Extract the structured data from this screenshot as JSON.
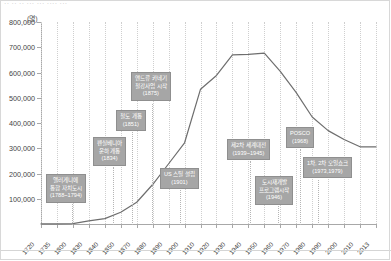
{
  "header": {
    "cut_off_text": "·· ·· ·· ··· ··· ···· ···"
  },
  "axis": {
    "unit_label": "(명)"
  },
  "chart_data": {
    "type": "line",
    "title": "",
    "subtitle": "",
    "xlabel": "",
    "ylabel": "(명)",
    "ylim": [
      0,
      800000
    ],
    "xlim": [
      1720,
      2013
    ],
    "grid": true,
    "legend_position": "none",
    "y_ticks": [
      "100,000",
      "200,000",
      "300,000",
      "400,000",
      "500,000",
      "600,000",
      "700,000",
      "800,000"
    ],
    "y_tick_values": [
      100000,
      200000,
      300000,
      400000,
      500000,
      600000,
      700000,
      800000
    ],
    "x_tick_labels": [
      "1720",
      "1735",
      "1800",
      "1830",
      "1840",
      "1850",
      "1870",
      "1880",
      "1890",
      "1900",
      "1910",
      "1920",
      "1930",
      "1940",
      "1950",
      "1960",
      "1970",
      "1980",
      "1990",
      "2000",
      "2010",
      "2013"
    ],
    "series": [
      {
        "name": "인구",
        "x": [
          1720,
          1735,
          1800,
          1830,
          1840,
          1850,
          1870,
          1880,
          1890,
          1900,
          1910,
          1920,
          1930,
          1940,
          1950,
          1960,
          1970,
          1980,
          1990,
          2000,
          2010,
          2013
        ],
        "values": [
          200,
          500,
          1565,
          12568,
          21115,
          46601,
          86076,
          156389,
          238617,
          321616,
          533905,
          588343,
          669817,
          671659,
          676806,
          604332,
          520117,
          423938,
          369879,
          334563,
          305704,
          305841
        ]
      }
    ],
    "annotations": [
      {
        "id": "allegheny-merge",
        "lines": [
          "앨러게니에",
          "통합 자치도시",
          "(1788~1794)"
        ],
        "year": 1791
      },
      {
        "id": "pennsylvania-canal",
        "lines": [
          "펜실베니아",
          "운하 개통",
          "(1834)"
        ],
        "year": 1834
      },
      {
        "id": "railroad-open",
        "lines": [
          "철도 개통",
          "(1851)"
        ],
        "year": 1851
      },
      {
        "id": "carnegie-steel",
        "lines": [
          "앤드류 카네기",
          "철강사업 시작",
          "(1875)"
        ],
        "year": 1875
      },
      {
        "id": "us-steel",
        "lines": [
          "US 스틸 설립",
          "(1901)"
        ],
        "year": 1901
      },
      {
        "id": "world-war-2",
        "lines": [
          "제2차 세계대전",
          "(1939~1945)"
        ],
        "year": 1942
      },
      {
        "id": "urban-renewal",
        "lines": [
          "도시재개발",
          "프로그램시작",
          "(1946)"
        ],
        "year": 1946
      },
      {
        "id": "posco",
        "lines": [
          "POSCO",
          "(1968)"
        ],
        "year": 1968
      },
      {
        "id": "oil-shock",
        "lines": [
          "1차, 2차 오일쇼크",
          "(1973,1979)"
        ],
        "year": 1976
      }
    ]
  },
  "colors": {
    "line": "#6e6e6e",
    "callout_bg": "#a6a6a6",
    "callout_text": "#ffffff",
    "axis": "#a8a8a8",
    "grid": "#cfcfcf",
    "tick_text": "#3a3a3a"
  }
}
